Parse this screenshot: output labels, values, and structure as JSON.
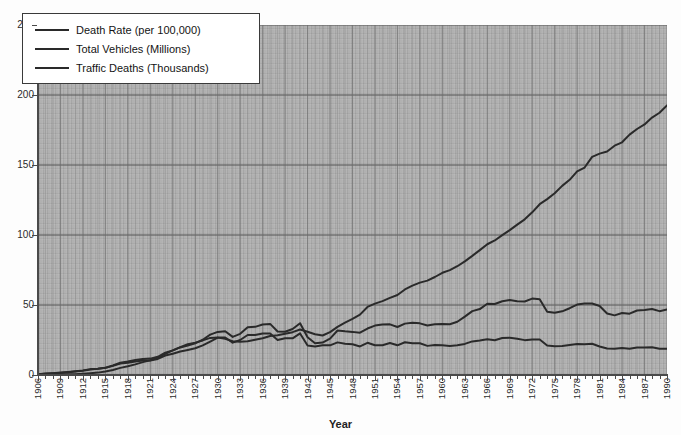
{
  "chart_data": {
    "type": "line",
    "title": "",
    "xlabel": "Year",
    "ylabel": "",
    "grid": true,
    "legend_position": "top-left",
    "xlim": [
      1906,
      1990
    ],
    "ylim": [
      0,
      250
    ],
    "y_ticks": [
      0,
      50,
      100,
      150,
      200,
      250
    ],
    "x_ticks": [
      "1906",
      "1909",
      "1912",
      "1915",
      "1918",
      "1921",
      "1924",
      "1927",
      "1930",
      "1933",
      "1936",
      "1939",
      "1942",
      "1945",
      "1948",
      "1951",
      "1954",
      "1957",
      "1960",
      "1963",
      "1966",
      "1969",
      "1972",
      "1975",
      "1978",
      "1981",
      "1984",
      "1987",
      "1990"
    ],
    "x": [
      1906,
      1907,
      1908,
      1909,
      1910,
      1911,
      1912,
      1913,
      1914,
      1915,
      1916,
      1917,
      1918,
      1919,
      1920,
      1921,
      1922,
      1923,
      1924,
      1925,
      1926,
      1927,
      1928,
      1929,
      1930,
      1931,
      1932,
      1933,
      1934,
      1935,
      1936,
      1937,
      1938,
      1939,
      1940,
      1941,
      1942,
      1943,
      1944,
      1945,
      1946,
      1947,
      1948,
      1949,
      1950,
      1951,
      1952,
      1953,
      1954,
      1955,
      1956,
      1957,
      1958,
      1959,
      1960,
      1961,
      1962,
      1963,
      1964,
      1965,
      1966,
      1967,
      1968,
      1969,
      1970,
      1971,
      1972,
      1973,
      1974,
      1975,
      1976,
      1977,
      1978,
      1979,
      1980,
      1981,
      1982,
      1983,
      1984,
      1985,
      1986,
      1987,
      1988,
      1989,
      1990
    ],
    "series": [
      {
        "name": "Death Rate (per 100,000)",
        "unit": "per 100,000",
        "values": [
          0.6,
          1.0,
          1.3,
          1.7,
          2.2,
          2.7,
          3.3,
          4.2,
          4.5,
          5.1,
          6.5,
          8.2,
          8.7,
          9.6,
          10.3,
          10.4,
          11.5,
          13.9,
          15.2,
          16.8,
          17.9,
          19.1,
          21.2,
          23.9,
          26.7,
          26.8,
          23.1,
          25.0,
          28.6,
          28.6,
          29.7,
          29.7,
          25.0,
          26.2,
          26.2,
          29.7,
          21.1,
          20.4,
          21.2,
          21.2,
          23.3,
          22.4,
          22.0,
          20.4,
          23.0,
          21.3,
          21.3,
          22.8,
          21.2,
          23.4,
          22.6,
          22.7,
          20.8,
          21.5,
          21.2,
          20.8,
          21.3,
          22.2,
          24.0,
          24.6,
          25.5,
          24.8,
          26.4,
          26.6,
          25.9,
          24.9,
          25.4,
          25.4,
          21.1,
          20.6,
          20.7,
          21.5,
          22.1,
          22.0,
          22.3,
          20.4,
          18.9,
          18.8,
          19.2,
          18.8,
          19.6,
          19.7,
          19.8,
          18.7,
          18.8
        ]
      },
      {
        "name": "Total Vehicles (Millions)",
        "unit": "millions",
        "values": [
          0.1,
          0.2,
          0.2,
          0.3,
          0.5,
          0.6,
          0.9,
          1.3,
          1.7,
          2.5,
          3.6,
          5.1,
          6.2,
          7.6,
          9.2,
          10.5,
          12.3,
          15.1,
          17.6,
          19.9,
          22.0,
          23.1,
          24.7,
          26.5,
          26.7,
          25.8,
          24.1,
          23.8,
          24.1,
          25.2,
          26.2,
          27.9,
          28.4,
          29.5,
          30.6,
          32.5,
          30.9,
          29.1,
          28.2,
          30.6,
          34.4,
          37.4,
          40.1,
          43.1,
          48.6,
          51.0,
          52.8,
          55.1,
          57.1,
          61.1,
          63.8,
          66.0,
          67.4,
          70.0,
          73.0,
          74.9,
          77.7,
          81.2,
          85.1,
          89.2,
          93.4,
          96.1,
          99.9,
          103.5,
          107.4,
          111.2,
          116.2,
          122.0,
          125.6,
          129.8,
          135.1,
          139.4,
          145.4,
          148.2,
          155.8,
          158.1,
          159.6,
          163.8,
          166.2,
          171.7,
          175.7,
          179.0,
          183.9,
          187.3,
          192.6
        ]
      },
      {
        "name": "Traffic Deaths (Thousands)",
        "unit": "thousands",
        "values": [
          0.5,
          0.9,
          1.2,
          1.5,
          2.0,
          2.5,
          3.1,
          4.0,
          4.5,
          5.2,
          6.8,
          8.8,
          9.6,
          10.7,
          11.5,
          11.7,
          13.0,
          15.9,
          17.6,
          19.7,
          21.0,
          22.6,
          25.2,
          28.8,
          30.8,
          31.2,
          27.2,
          29.4,
          34.1,
          34.4,
          36.1,
          36.5,
          31.1,
          30.9,
          32.9,
          37.0,
          27.0,
          22.7,
          23.2,
          26.0,
          31.8,
          31.2,
          30.8,
          30.2,
          33.2,
          35.3,
          36.1,
          36.2,
          34.3,
          36.7,
          37.3,
          36.9,
          35.3,
          36.2,
          36.4,
          36.3,
          38.0,
          41.7,
          45.6,
          47.1,
          50.9,
          50.7,
          52.7,
          53.5,
          52.6,
          52.5,
          54.6,
          54.1,
          45.2,
          44.5,
          45.5,
          47.7,
          50.3,
          51.1,
          51.1,
          49.3,
          43.9,
          42.6,
          44.3,
          43.8,
          46.1,
          46.4,
          47.1,
          45.6,
          46.8
        ]
      }
    ]
  },
  "legend": {
    "items": [
      {
        "label": "Death Rate (per 100,000)",
        "color": "#2a2a2a"
      },
      {
        "label": "Total Vehicles (Millions)",
        "color": "#2a2a2a"
      },
      {
        "label": "Traffic Deaths (Thousands)",
        "color": "#2a2a2a"
      }
    ]
  },
  "axes": {
    "x_title": "Year",
    "y_tick_labels": [
      "250",
      "200",
      "150",
      "100",
      "50",
      "0"
    ],
    "x_tick_labels": [
      "1906",
      "1909",
      "1912",
      "1915",
      "1918",
      "1921",
      "1924",
      "1927",
      "1930",
      "1933",
      "1936",
      "1939",
      "1942",
      "1945",
      "1948",
      "1951",
      "1954",
      "1957",
      "1960",
      "1963",
      "1966",
      "1969",
      "1972",
      "1975",
      "1978",
      "1981",
      "1984",
      "1987",
      "1990"
    ]
  },
  "style": {
    "plot_background": "#a9a9a9",
    "line_color": "#2a2a2a",
    "axis_color": "#4a4a4a",
    "gridline_color": "#6e6e6e"
  },
  "title": ""
}
